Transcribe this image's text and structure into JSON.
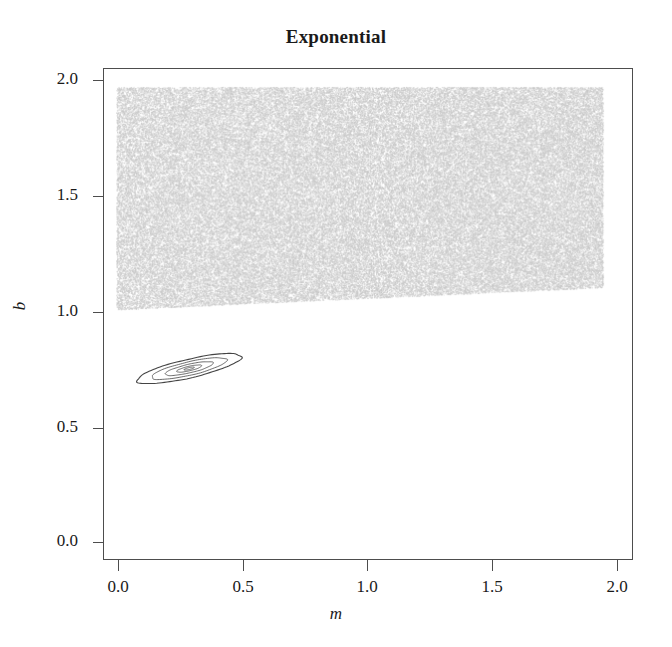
{
  "chart_data": {
    "type": "scatter",
    "title": "Exponential",
    "xlabel": "m",
    "ylabel": "b",
    "xlim": [
      -0.05,
      2.12
    ],
    "ylim": [
      -0.12,
      2.08
    ],
    "grid": false,
    "legend": null,
    "xticks": [
      "0.0",
      "0.5",
      "1.0",
      "1.5",
      "2.0"
    ],
    "xtick_values": [
      0.0,
      0.5,
      1.0,
      1.5,
      2.0
    ],
    "yticks": [
      "0.0",
      "0.5",
      "1.0",
      "1.5",
      "2.0"
    ],
    "ytick_values": [
      0.0,
      0.5,
      1.0,
      1.5,
      2.0
    ],
    "series": [
      {
        "name": "prior-samples",
        "type": "scatter",
        "render": "dense-speckle-region",
        "color": "#c8c8c8",
        "description": "Dense gray sample cloud filling a band across the parameter space",
        "region_polygon": [
          [
            0.0,
            2.0
          ],
          [
            2.0,
            2.0
          ],
          [
            2.0,
            1.1
          ],
          [
            0.0,
            1.0
          ]
        ],
        "point_count_estimate": 20000
      },
      {
        "name": "posterior-contours",
        "type": "contour",
        "color": "#3a3a3a",
        "description": "Nested tilted elliptical contour levels of the posterior density",
        "center": [
          0.3,
          0.735
        ],
        "semi_major": 0.22,
        "semi_minor": 0.042,
        "rotation_deg": -13,
        "levels": [
          1.0,
          0.72,
          0.46,
          0.24,
          0.1
        ]
      }
    ],
    "colors": {
      "sample_cloud": "#c8c8c8",
      "contour_line": "#3a3a3a",
      "axis": "#4d4d4d",
      "text": "#1a1a1a",
      "background": "#ffffff"
    }
  }
}
